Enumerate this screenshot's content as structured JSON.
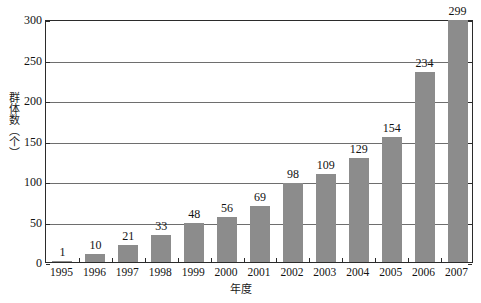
{
  "chart_data": {
    "type": "bar",
    "title": "",
    "subtitle": "",
    "xlabel": "年度",
    "ylabel": "群体数（个）",
    "categories": [
      "1995",
      "1996",
      "1997",
      "1998",
      "1999",
      "2000",
      "2001",
      "2002",
      "2003",
      "2004",
      "2005",
      "2006",
      "2007"
    ],
    "values": [
      1,
      10,
      21,
      33,
      48,
      56,
      69,
      98,
      109,
      129,
      154,
      234,
      299
    ],
    "series": [
      {
        "name": "群体数",
        "values": [
          1,
          10,
          21,
          33,
          48,
          56,
          69,
          98,
          109,
          129,
          154,
          234,
          299
        ]
      }
    ],
    "ylim": [
      0,
      300
    ],
    "yticks": [
      0,
      50,
      100,
      150,
      200,
      250,
      300
    ],
    "ytick_labels": [
      "0",
      "50",
      "100",
      "150",
      "200",
      "250",
      "300"
    ],
    "grid": true,
    "grid_axis": "y",
    "legend": false,
    "legend_position": "none",
    "data_labels": true,
    "bar_color": "#8c8c8c",
    "axis_color": "#2b2b2b",
    "gridline_color": "#6e6e6e",
    "background_color": "#ffffff"
  }
}
